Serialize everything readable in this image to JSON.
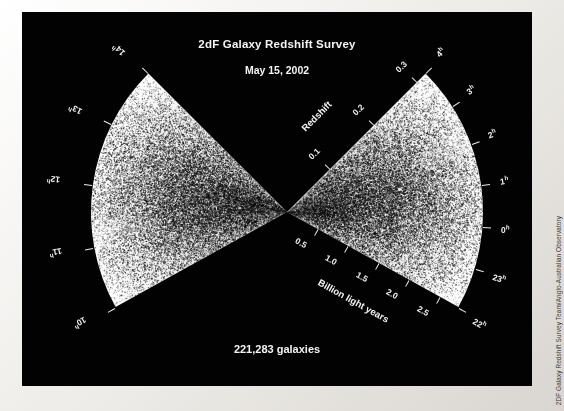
{
  "figure": {
    "title": "2dF Galaxy Redshift Survey",
    "subtitle": "May 15, 2002",
    "count_label": "221,283 galaxies",
    "credit": "2DF Galaxy Redshift Survey Team/Anglo-Australian Observatory",
    "background_color": "#020202",
    "point_color": "#111111",
    "text_color": "#f4f4f4",
    "border_color": "#eceae6"
  },
  "chart_data": {
    "type": "scatter",
    "title": "2dF Galaxy Redshift Survey",
    "subtitle": "May 15, 2002",
    "annotation": "221,283 galaxies",
    "n_points": 221283,
    "apex": {
      "x": 287,
      "y": 212
    },
    "radial_axes": [
      {
        "name": "Redshift",
        "label": "Redshift",
        "ticks": [
          "0.1",
          "0.2",
          "0.3"
        ],
        "values": [
          0.1,
          0.2,
          0.3
        ],
        "range": [
          0,
          0.32
        ],
        "position": "upper-left edge of right wedge"
      },
      {
        "name": "Billion light years",
        "label": "Billion light years",
        "ticks": [
          "0.5",
          "1.0",
          "1.5",
          "2.0",
          "2.5"
        ],
        "values": [
          0.5,
          1.0,
          1.5,
          2.0,
          2.5
        ],
        "range": [
          0,
          2.8
        ],
        "position": "lower-left edge of right wedge"
      }
    ],
    "angular_axis": {
      "name": "Right ascension",
      "unit": "h",
      "right_wedge_ticks": [
        "4",
        "3",
        "2",
        "1",
        "0",
        "23",
        "22"
      ],
      "right_wedge_values": [
        4,
        3,
        2,
        1,
        0,
        23,
        22
      ],
      "left_wedge_ticks": [
        "10",
        "11",
        "12",
        "13",
        "14"
      ],
      "left_wedge_values": [
        10,
        11,
        12,
        13,
        14
      ]
    },
    "grid": false,
    "legend": false
  }
}
